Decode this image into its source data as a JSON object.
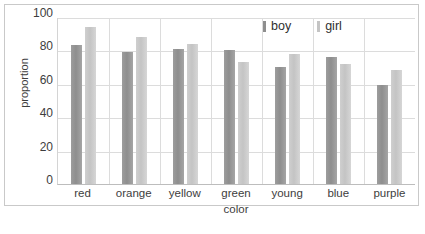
{
  "chart_data": {
    "type": "bar",
    "title": "",
    "xlabel": "color",
    "ylabel": "proportion",
    "categories": [
      "red",
      "orange",
      "yellow",
      "green",
      "young",
      "blue",
      "purple"
    ],
    "series": [
      {
        "name": "boy",
        "color": "#8e8e8e",
        "values": [
          83,
          79,
          81,
          80,
          70,
          76,
          59
        ]
      },
      {
        "name": "girl",
        "color": "#c4c4c4",
        "values": [
          94,
          88,
          84,
          73,
          78,
          72,
          68
        ]
      }
    ],
    "ylim": [
      0,
      100
    ],
    "yticks": [
      0,
      20,
      40,
      60,
      80,
      100
    ],
    "ytick_labels": [
      "0",
      "20",
      "40",
      "60",
      "80",
      "100"
    ],
    "grid": "horizontal-and-vertical",
    "legend_position": "top-right"
  }
}
